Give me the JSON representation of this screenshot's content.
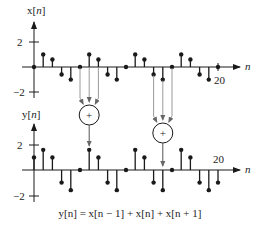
{
  "colors": {
    "ink": "#1a1a1a",
    "connector": "#9a9a9a"
  },
  "top_plot": {
    "label": "x[n]",
    "label_prefix": "x[",
    "label_var": "n",
    "label_suffix": "]",
    "axis_var": "n",
    "tick_pos_label": "2",
    "tick_neg_label": "−2",
    "end_tick_label": "20"
  },
  "bottom_plot": {
    "label": "y[n]",
    "label_prefix": "y[",
    "label_var": "n",
    "label_suffix": "]",
    "axis_var": "n",
    "tick_pos_label": "2",
    "tick_neg_label": "−2",
    "end_tick_label": "20"
  },
  "adder_symbol": "+",
  "equation": "y[n] = x[n − 1] + x[n] + x[n + 1]",
  "chart_data": [
    {
      "type": "stem",
      "title": "x[n]",
      "xlabel": "n",
      "ylabel": "x[n]",
      "yticks": [
        -2,
        2
      ],
      "xlim": [
        0,
        20
      ],
      "ylim": [
        -2.5,
        2.8
      ],
      "x": [
        0,
        1,
        2,
        3,
        4,
        5,
        6,
        7,
        8,
        9,
        10,
        11,
        12,
        13,
        14,
        15,
        16,
        17,
        18,
        19,
        20
      ],
      "values": [
        0,
        1,
        0.6,
        -0.6,
        -1,
        0,
        1,
        0.6,
        -0.6,
        -1,
        0,
        1,
        0.6,
        -0.6,
        -1,
        0,
        1,
        0.6,
        -0.6,
        -1,
        0
      ]
    },
    {
      "type": "stem",
      "title": "y[n]",
      "xlabel": "n",
      "ylabel": "y[n]",
      "yticks": [
        -2,
        2
      ],
      "xlim": [
        0,
        20
      ],
      "ylim": [
        -2.5,
        2.8
      ],
      "x": [
        0,
        1,
        2,
        3,
        4,
        5,
        6,
        7,
        8,
        9,
        10,
        11,
        12,
        13,
        14,
        15,
        16,
        17,
        18,
        19,
        20
      ],
      "values": [
        1,
        1.6,
        1,
        -1,
        -1.6,
        0,
        1.6,
        1,
        -1,
        -1.6,
        0,
        1.6,
        1,
        -1,
        -1.6,
        0,
        1.6,
        1,
        -1,
        -1.6,
        -1
      ]
    }
  ],
  "adders": [
    {
      "name": "adder-n6",
      "inputs_n": [
        5,
        6,
        7
      ],
      "output_n": 6
    },
    {
      "name": "adder-n14",
      "inputs_n": [
        13,
        14,
        15
      ],
      "output_n": 14
    }
  ]
}
